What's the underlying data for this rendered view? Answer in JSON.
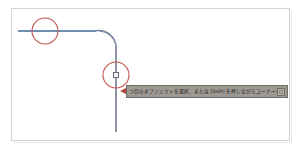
{
  "app": {
    "kind": "cad-drawing-canvas",
    "background_color": "#ffffff",
    "frame_border_color": "#d3d3d3"
  },
  "canvas": {
    "name": "drawing-area",
    "geometry_color": "#5a7fa8",
    "geometry_stroke_color": "#7d8394",
    "annotation_color": "#c0564a",
    "polyline": {
      "label": "filleted-polyline",
      "horizontal_segment": {
        "x1": 18,
        "y1": 31,
        "x2": 95,
        "y2": 31
      },
      "fillet_arc": {
        "cx": 95,
        "cy": 48,
        "r": 17,
        "start_deg": 270,
        "end_deg": 360
      },
      "vertical_segment": {
        "x1": 116,
        "y1": 48,
        "x2": 116,
        "y2": 132
      }
    },
    "annotations": [
      {
        "name": "annotation-circle-start-point",
        "cx": 45,
        "cy": 31,
        "r": 13,
        "stroke": "#c0564a",
        "stroke_width": 1.1
      },
      {
        "name": "annotation-circle-grip-point",
        "cx": 116,
        "cy": 75,
        "r": 13,
        "stroke": "#c0564a",
        "stroke_width": 1.1
      }
    ],
    "grip_marker": {
      "name": "grip-square",
      "x": 113,
      "y": 72,
      "size": 6,
      "fill": "#f2f2f2",
      "stroke": "#6b6b7a"
    }
  },
  "tooltip": {
    "name": "command-prompt-tooltip",
    "background_color": "#9e9a93",
    "border_color": "#6f6c66",
    "text": "つ目のオブジェクトを選択、または [Shift] を押しながらコーナーを適用、または",
    "close_button_label": "",
    "pointer_color": "#b0453a"
  }
}
